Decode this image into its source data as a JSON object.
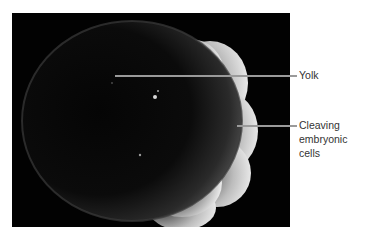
{
  "figure": {
    "labels": [
      {
        "id": "yolk",
        "text": "Yolk"
      },
      {
        "id": "cleaving",
        "lines": [
          "Cleaving",
          "embryonic",
          "cells"
        ]
      }
    ],
    "colors": {
      "background": "#020202",
      "leader_line": "#9a9a9a",
      "label_text": "#333333"
    }
  }
}
